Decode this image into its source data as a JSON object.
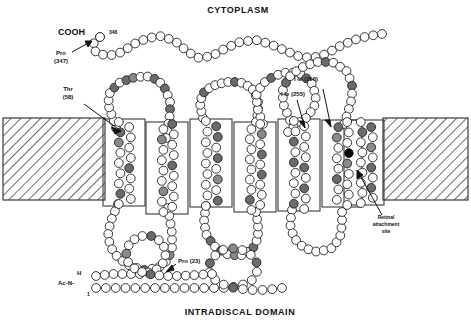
{
  "figure": {
    "type": "membrane-topology-diagram",
    "top_region_label": "CYTOPLASM",
    "bottom_region_label": "INTRADISCAL DOMAIN",
    "membrane": {
      "fill_pattern": "diagonal-hatch",
      "top_y": 118,
      "bottom_y": 200,
      "line_color": "#333333"
    },
    "helices": {
      "count": 7,
      "outline_color": "#333333"
    },
    "residue_colors": {
      "plain": "#ffffff",
      "shaded": "#6b6b6b",
      "checkered": "#8a8a8a",
      "filled": "#000000",
      "stroke": "#222222"
    }
  },
  "annotations": [
    {
      "id": "cooh",
      "text": "COOH",
      "note": "C-terminus label"
    },
    {
      "id": "res348",
      "text": "348",
      "note": "residue number at C-terminus"
    },
    {
      "id": "pro347",
      "line1": "Pro",
      "line2": "(347)"
    },
    {
      "id": "thr58",
      "line1": "Thr",
      "line2": "(58)"
    },
    {
      "id": "ile256",
      "text": "I le (256)"
    },
    {
      "id": "ile255",
      "text": "I le (255)"
    },
    {
      "id": "retinal",
      "line1": "Retinal",
      "line2": "attachment",
      "line3": "site"
    },
    {
      "id": "pro23",
      "text": "Pro (23)"
    },
    {
      "id": "acn",
      "line1": "H",
      "line2": "Ac-N-",
      "line3": "1",
      "note": "N-terminus, acetylated"
    }
  ],
  "labels": {
    "cytoplasm": "CYTOPLASM",
    "intradiscal": "INTRADISCAL DOMAIN",
    "cooh": "COOH",
    "num348": "348",
    "pro_a": "Pro",
    "pro_a_num": "(347)",
    "thr_a": "Thr",
    "thr_a_num": "(58)",
    "ile256": "I le (256)",
    "ile255": "I le (255)",
    "retinal1": "Retinal",
    "retinal2": "attachment",
    "retinal3": "site",
    "pro23": "Pro (23)",
    "nterm_h": "H",
    "nterm_ac": "Ac-N-",
    "nterm_1": "1"
  }
}
